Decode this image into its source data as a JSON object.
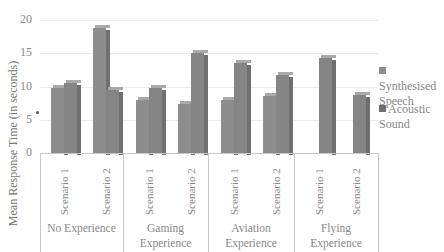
{
  "chart_data": {
    "type": "bar",
    "title": "",
    "xlabel": "",
    "ylabel": "Mean Response Time (in seconds)",
    "ylim": [
      0,
      20
    ],
    "yticks": [
      0,
      5,
      10,
      15,
      20
    ],
    "grid": true,
    "legend_position": "right",
    "group_categories": [
      "No Experience",
      "Gaming Experience",
      "Aviation Experience",
      "Flying Experience"
    ],
    "subcategories": [
      "Scenario 1",
      "Scenario 2"
    ],
    "categories": [
      "No Experience - Scenario 1",
      "No Experience - Scenario 2",
      "Gaming Experience - Scenario 1",
      "Gaming Experience - Scenario 2",
      "Aviation Experience - Scenario 1",
      "Aviation Experience - Scenario 2",
      "Flying Experience - Scenario 1",
      "Flying Experience - Scenario 2"
    ],
    "series": [
      {
        "name": "Synthesised Speech",
        "color": "#8d8d8d",
        "values": [
          9.7,
          18.8,
          7.9,
          7.4,
          8.0,
          8.5,
          null,
          null
        ]
      },
      {
        "name": "Acoustic Sound",
        "color": "#7a7a7a",
        "values": [
          10.6,
          9.4,
          9.8,
          15.0,
          13.5,
          11.7,
          14.3,
          8.7
        ]
      }
    ]
  },
  "labels": {
    "ylabel": "Mean Response Time (in seconds)",
    "yticks": [
      "0",
      "5",
      "10",
      "15",
      "20"
    ],
    "scenario1": "Scenario 1",
    "scenario2": "Scenario 2",
    "groups": [
      [
        "No Experience"
      ],
      [
        "Gaming",
        "Experience"
      ],
      [
        "Aviation",
        "Experience"
      ],
      [
        "Flying",
        "Experience"
      ]
    ],
    "legend": [
      [
        "Synthesised",
        "Speech"
      ],
      [
        "Acoustic",
        "Sound"
      ]
    ]
  }
}
